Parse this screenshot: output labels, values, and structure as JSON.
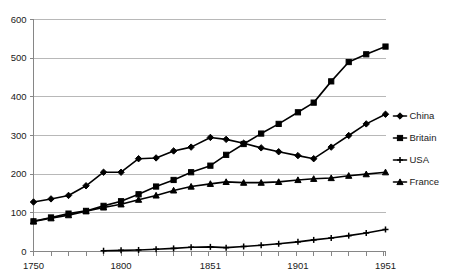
{
  "chart_data": {
    "type": "line",
    "title": "",
    "xlabel": "",
    "ylabel": "",
    "xlim": [
      1750,
      1951
    ],
    "ylim": [
      0,
      600
    ],
    "yticks": [
      0,
      100,
      200,
      300,
      400,
      500,
      600
    ],
    "xticks_labeled": [
      1750,
      1800,
      1851,
      1901,
      1951
    ],
    "xtick_step": 10,
    "grid": true,
    "legend_position": "right",
    "series": [
      {
        "name": "China",
        "marker": "diamond",
        "color": "#000000",
        "x": [
          1750,
          1760,
          1770,
          1780,
          1790,
          1800,
          1810,
          1820,
          1830,
          1840,
          1851,
          1860,
          1870,
          1880,
          1890,
          1901,
          1910,
          1920,
          1930,
          1940,
          1951
        ],
        "values": [
          128,
          136,
          145,
          170,
          205,
          205,
          240,
          242,
          260,
          270,
          295,
          290,
          280,
          268,
          258,
          248,
          240,
          270,
          300,
          330,
          355
        ]
      },
      {
        "name": "Britain",
        "marker": "square",
        "color": "#000000",
        "x": [
          1750,
          1760,
          1770,
          1780,
          1790,
          1800,
          1810,
          1820,
          1830,
          1840,
          1851,
          1860,
          1870,
          1880,
          1890,
          1901,
          1910,
          1920,
          1930,
          1940,
          1951
        ],
        "values": [
          78,
          88,
          98,
          105,
          118,
          130,
          148,
          168,
          185,
          205,
          222,
          250,
          278,
          305,
          330,
          360,
          385,
          440,
          490,
          510,
          530
        ]
      },
      {
        "name": "USA",
        "marker": "cross",
        "color": "#000000",
        "x": [
          1790,
          1800,
          1810,
          1820,
          1830,
          1840,
          1851,
          1860,
          1870,
          1880,
          1890,
          1901,
          1910,
          1920,
          1930,
          1940,
          1951
        ],
        "values": [
          2,
          3,
          4,
          6,
          8,
          11,
          12,
          10,
          13,
          16,
          20,
          25,
          30,
          35,
          41,
          48,
          57
        ]
      },
      {
        "name": "France",
        "marker": "triangle",
        "color": "#000000",
        "x": [
          1750,
          1760,
          1770,
          1780,
          1790,
          1800,
          1810,
          1820,
          1830,
          1840,
          1851,
          1860,
          1870,
          1880,
          1890,
          1901,
          1910,
          1920,
          1930,
          1940,
          1951
        ],
        "values": [
          78,
          86,
          94,
          104,
          114,
          122,
          134,
          145,
          158,
          168,
          175,
          180,
          178,
          178,
          180,
          185,
          188,
          190,
          196,
          200,
          205
        ]
      }
    ]
  },
  "legend": {
    "entries": [
      {
        "label": "China"
      },
      {
        "label": "Britain"
      },
      {
        "label": "USA"
      },
      {
        "label": "France"
      }
    ]
  },
  "axes": {
    "y_tick_labels": [
      "600",
      "500",
      "400",
      "300",
      "200",
      "100",
      "0"
    ],
    "x_tick_labels": [
      "1750",
      "1800",
      "1851",
      "1901",
      "1951"
    ]
  }
}
